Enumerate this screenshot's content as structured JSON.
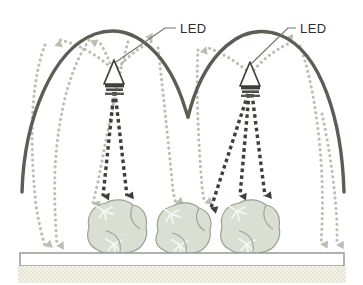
{
  "figure": {
    "background_color": "#ffffff",
    "width": 363,
    "height": 285
  },
  "labels": {
    "led_left": "LED",
    "led_right": "LED"
  },
  "colors": {
    "reflector_stroke": "#5a5f56",
    "direct_ray": "#3c4038",
    "reflected_ray": "#b9c0b2",
    "plant_fill": "#dadfd3",
    "plant_stroke": "#9aa294",
    "plant_vein": "#f4f6f1",
    "bench_fill": "#ffffff",
    "bench_stroke": "#8d948a",
    "substrate_fill": "#f2f1e6",
    "substrate_speckle": "#d4d0b4",
    "leader_line": "#6f746c",
    "label_text": "#2e2e2e",
    "led_body": "#3d4139"
  },
  "components": {
    "reflectors": [
      {
        "name": "reflector-left",
        "apex_x": 110,
        "apex_y": 33,
        "left_x": 22,
        "left_y": 192,
        "right_x": 188,
        "right_y": 113
      },
      {
        "name": "reflector-right",
        "apex_x": 250,
        "apex_y": 38,
        "left_x": 188,
        "left_y": 113,
        "right_x": 344,
        "right_y": 192
      }
    ],
    "leds": [
      {
        "name": "led-left",
        "x": 114,
        "y": 74,
        "label": "LED",
        "label_x": 196,
        "label_y": 32
      },
      {
        "name": "led-right",
        "x": 250,
        "y": 76,
        "label": "LED",
        "label_x": 303,
        "label_y": 32
      }
    ],
    "plants": [
      {
        "name": "plant-1",
        "cx": 115,
        "cy": 231,
        "rx": 28,
        "ry": 22
      },
      {
        "name": "plant-2",
        "cx": 182,
        "cy": 233,
        "rx": 26,
        "ry": 21
      },
      {
        "name": "plant-3",
        "cx": 248,
        "cy": 231,
        "rx": 28,
        "ry": 22
      }
    ],
    "bench": {
      "name": "grow-bench",
      "x": 20,
      "y": 253,
      "width": 324,
      "height": 13
    },
    "substrate": {
      "name": "substrate-band",
      "x": 18,
      "y": 266,
      "width": 328,
      "height": 17
    }
  },
  "ray_legend": {
    "direct_ray_description": "direct LED light (dark dotted arrows)",
    "reflected_ray_description": "reflected light off the dome reflector (pale dotted arrows)"
  }
}
